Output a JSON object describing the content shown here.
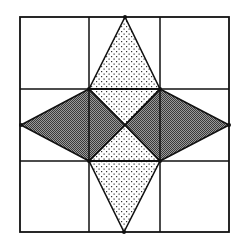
{
  "figure": {
    "colors": {
      "background": "#ffffff",
      "line": "#111111",
      "dark_fill": "#7a7a7a",
      "dark_hatch": "#3a3a3a",
      "dot_fill": "#ffffff",
      "dot": "#333333"
    },
    "grid": {
      "outer": {
        "x": 20,
        "y": 17,
        "width": 209,
        "height": 215
      },
      "vertical_lines_x": [
        89,
        160
      ],
      "horizontal_lines_y": [
        89,
        161
      ]
    },
    "points": {
      "top": [
        125,
        17
      ],
      "bottom": [
        124,
        232
      ],
      "left": [
        21,
        125
      ],
      "right": [
        229,
        125
      ],
      "center": [
        125,
        125
      ],
      "tl": [
        89,
        89
      ],
      "tr": [
        160,
        89
      ],
      "bl": [
        89,
        161
      ],
      "br": [
        160,
        161
      ]
    },
    "shapes": [
      {
        "name": "top-dotted-triangle",
        "fill": "dots",
        "points": "125,17 160,89 89,89"
      },
      {
        "name": "upper-dotted-center-triangle",
        "fill": "dots",
        "points": "89,89 160,89 125,125"
      },
      {
        "name": "lower-dotted-center-triangle",
        "fill": "dots",
        "points": "89,161 160,161 125,125"
      },
      {
        "name": "bottom-dotted-triangle",
        "fill": "dots",
        "points": "89,161 160,161 124,232"
      },
      {
        "name": "left-dark-kite",
        "fill": "hatch",
        "points": "21,125 89,89 125,125 89,161"
      },
      {
        "name": "right-dark-kite",
        "fill": "hatch",
        "points": "229,125 160,89 125,125 160,161"
      }
    ]
  }
}
